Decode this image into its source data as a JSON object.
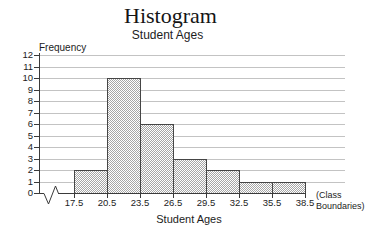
{
  "chart_data": {
    "type": "bar",
    "chart_kind": "histogram",
    "title": "Histogram",
    "subtitle": "Student Ages",
    "ylabel": "Frequency",
    "xlabel": "Student Ages",
    "x_axis_note": "(Class Boundaries)",
    "class_boundaries": [
      "17.5",
      "20.5",
      "23.5",
      "26.5",
      "29.5",
      "32.5",
      "35.5",
      "38.5"
    ],
    "frequencies": [
      2,
      10,
      6,
      3,
      2,
      1,
      1
    ],
    "bins": [
      {
        "range": "17.5-20.5",
        "frequency": 2
      },
      {
        "range": "20.5-23.5",
        "frequency": 10
      },
      {
        "range": "23.5-26.5",
        "frequency": 6
      },
      {
        "range": "26.5-29.5",
        "frequency": 3
      },
      {
        "range": "29.5-32.5",
        "frequency": 2
      },
      {
        "range": "32.5-35.5",
        "frequency": 1
      },
      {
        "range": "35.5-38.5",
        "frequency": 1
      }
    ],
    "ylim": [
      0,
      12
    ],
    "ytick_labels": [
      "0",
      "1",
      "2",
      "3",
      "4",
      "5",
      "6",
      "7",
      "8",
      "9",
      "10",
      "11",
      "12"
    ],
    "grid": "horizontal",
    "legend": "none",
    "x_axis_break": true,
    "colors": {
      "background": "#ffffff",
      "bar_fill_effective": "#d4d4d4",
      "bar_pattern": "checker-dither",
      "bar_border": "#454545",
      "gridline": "#c3c3c3",
      "axis": "#3a3a3a",
      "text": "#1a1a1a"
    }
  }
}
